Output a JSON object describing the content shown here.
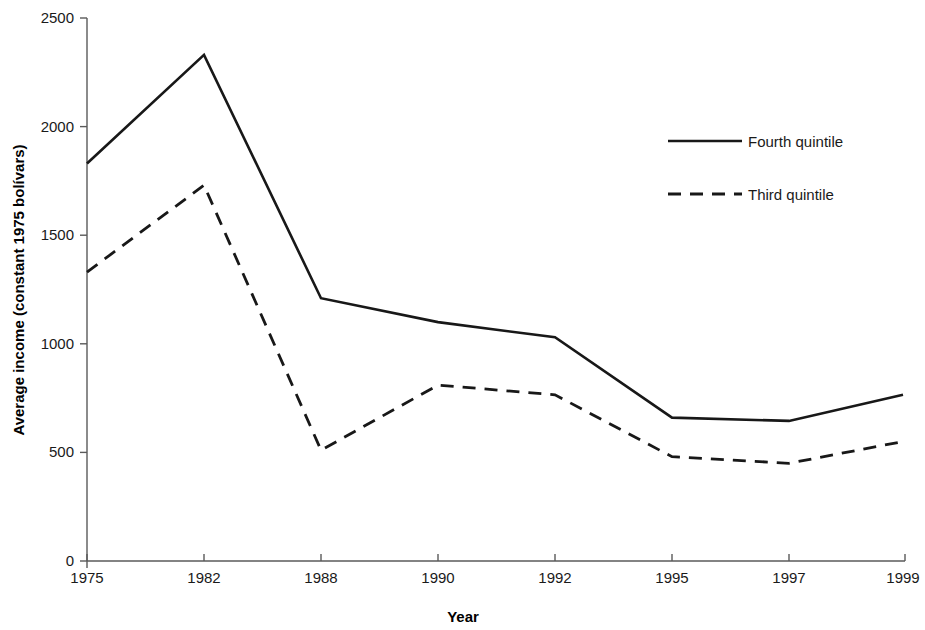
{
  "chart_data": {
    "type": "line",
    "title": "",
    "xlabel": "Year",
    "ylabel": "Average income (constant 1975 bolívars)",
    "categories": [
      "1975",
      "1982",
      "1988",
      "1990",
      "1992",
      "1995",
      "1997",
      "1999"
    ],
    "x_tick_labels": [
      "1975",
      "1982",
      "1988",
      "1990",
      "1992",
      "1995",
      "1997",
      "1999"
    ],
    "y_tick_labels": [
      "0",
      "500",
      "1000",
      "1500",
      "2000",
      "2500"
    ],
    "y_ticks": [
      0,
      500,
      1000,
      1500,
      2000,
      2500
    ],
    "ylim": [
      0,
      2500
    ],
    "grid": false,
    "legend_position": "upper-right",
    "series": [
      {
        "name": "Fourth quintile",
        "style": "solid",
        "values": [
          1830,
          2330,
          1210,
          1100,
          1030,
          660,
          645,
          765
        ]
      },
      {
        "name": "Third quintile",
        "style": "dashed",
        "values": [
          1330,
          1730,
          510,
          810,
          765,
          480,
          450,
          550
        ]
      }
    ]
  },
  "legend": {
    "entries": [
      {
        "label": "Fourth quintile",
        "style": "solid"
      },
      {
        "label": "Third quintile",
        "style": "dashed"
      }
    ]
  },
  "axes": {
    "x_title": "Year",
    "y_title": "Average income (constant 1975 bolívars)"
  }
}
